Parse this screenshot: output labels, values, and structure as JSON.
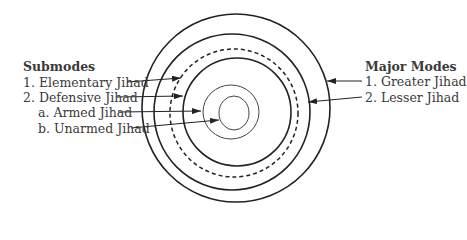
{
  "left_panel": {
    "title": "Submodes",
    "items": [
      {
        "label": "1. Elementary Jihad"
      },
      {
        "label": "2. Defensive Jihad"
      },
      {
        "label": "a. Armed Jihad"
      },
      {
        "label": "b. Unarmed Jihad"
      }
    ]
  },
  "right_panel": {
    "title": "Major Modes",
    "items": [
      {
        "label": "1. Greater Jihad"
      },
      {
        "label": "2. Lesser Jihad"
      }
    ]
  },
  "diagram": {
    "type": "concentric-circles",
    "rings": [
      {
        "name": "greater-jihad",
        "style": "solid"
      },
      {
        "name": "lesser-jihad",
        "style": "solid"
      },
      {
        "name": "elementary-jihad",
        "style": "dashed"
      },
      {
        "name": "defensive-jihad",
        "style": "solid"
      },
      {
        "name": "armed-jihad",
        "style": "thin"
      },
      {
        "name": "unarmed-jihad",
        "style": "thin"
      }
    ]
  }
}
